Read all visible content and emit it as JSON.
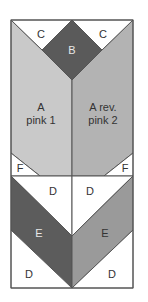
{
  "diagram": {
    "colors": {
      "background": "#ffffff",
      "outline": "#555555",
      "white_patch": "#ffffff",
      "A_left": "#c9c9c9",
      "A_right": "#b3b3b3",
      "B": "#5a5a5a",
      "E_left": "#5c5c5c",
      "E_right": "#9a9a9a",
      "label_dark": "#333333",
      "label_light": "#e8e8e8"
    },
    "labels": {
      "B": "B",
      "C_left": "C",
      "C_right": "C",
      "A_left_line1": "A",
      "A_left_line2": "pink 1",
      "A_right_line1": "A rev.",
      "A_right_line2": "pink 2",
      "F_left": "F",
      "F_right": "F",
      "D_top_left": "D",
      "D_top_right": "D",
      "E_left": "E",
      "E_right": "E",
      "D_bottom_left": "D",
      "D_bottom_right": "D"
    }
  }
}
